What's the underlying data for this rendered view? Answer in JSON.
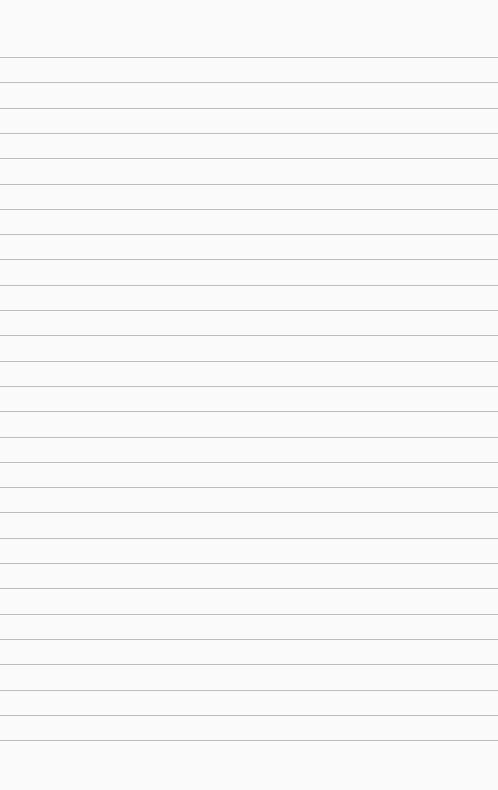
{
  "page": {
    "type": "blank lined paper",
    "background_color": "#fafafa",
    "line_color": "#bdbdbd",
    "first_line_y": 57,
    "line_spacing": 25.3,
    "line_count": 28
  }
}
